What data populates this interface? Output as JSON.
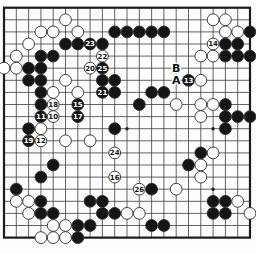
{
  "diagram": {
    "kind": "go-board-diagram",
    "board": {
      "cols": 21,
      "rows": 20,
      "origin_x": 4,
      "origin_y": 7.7,
      "spacing_x": 12.3,
      "spacing_y": 12.1,
      "stone_radius": 5.9
    },
    "colors": {
      "background": "#fdfdfd",
      "grid_line": "#3c3c3c",
      "border_line": "#1c1c1c",
      "black_stone": "#151515",
      "white_stone": "#ffffff",
      "stone_outline": "#2b2b2b",
      "number_on_black": "#ffffff",
      "number_on_white": "#111111",
      "letter_color": "#111111",
      "star_point": "#222222"
    },
    "letters": [
      {
        "c": 14,
        "r": 5,
        "text": "B"
      },
      {
        "c": 14,
        "r": 6,
        "text": "A"
      }
    ],
    "star_points": [
      {
        "c": 10,
        "r": 10
      },
      {
        "c": 17,
        "r": 10
      },
      {
        "c": 17,
        "r": 15
      }
    ],
    "stones": [
      {
        "c": 5,
        "r": 1,
        "color": "white"
      },
      {
        "c": 17,
        "r": 1,
        "color": "white"
      },
      {
        "c": 18,
        "r": 1,
        "color": "white"
      },
      {
        "c": 3,
        "r": 2,
        "color": "white"
      },
      {
        "c": 4,
        "r": 2,
        "color": "white"
      },
      {
        "c": 6,
        "r": 2,
        "color": "white"
      },
      {
        "c": 9,
        "r": 2,
        "color": "black"
      },
      {
        "c": 10,
        "r": 2,
        "color": "black"
      },
      {
        "c": 11,
        "r": 2,
        "color": "black"
      },
      {
        "c": 12,
        "r": 2,
        "color": "black"
      },
      {
        "c": 13,
        "r": 2,
        "color": "black"
      },
      {
        "c": 18,
        "r": 2,
        "color": "white"
      },
      {
        "c": 19,
        "r": 2,
        "color": "white"
      },
      {
        "c": 20,
        "r": 2,
        "color": "black"
      },
      {
        "c": 2,
        "r": 3,
        "color": "white"
      },
      {
        "c": 5,
        "r": 3,
        "color": "black"
      },
      {
        "c": 6,
        "r": 3,
        "color": "black"
      },
      {
        "c": 7,
        "r": 3,
        "color": "black",
        "n": "23"
      },
      {
        "c": 8,
        "r": 3,
        "color": "black"
      },
      {
        "c": 17,
        "r": 3,
        "color": "white",
        "n": "14"
      },
      {
        "c": 18,
        "r": 3,
        "color": "black"
      },
      {
        "c": 19,
        "r": 3,
        "color": "black"
      },
      {
        "c": 1,
        "r": 4,
        "color": "white"
      },
      {
        "c": 3,
        "r": 4,
        "color": "black"
      },
      {
        "c": 4,
        "r": 4,
        "color": "black"
      },
      {
        "c": 8,
        "r": 4,
        "color": "white",
        "n": "22"
      },
      {
        "c": 16,
        "r": 4,
        "color": "white"
      },
      {
        "c": 17,
        "r": 4,
        "color": "white"
      },
      {
        "c": 18,
        "r": 4,
        "color": "black"
      },
      {
        "c": 19,
        "r": 4,
        "color": "black"
      },
      {
        "c": 20,
        "r": 4,
        "color": "black"
      },
      {
        "c": 0,
        "r": 5,
        "color": "white"
      },
      {
        "c": 1,
        "r": 5,
        "color": "white"
      },
      {
        "c": 2,
        "r": 5,
        "color": "black"
      },
      {
        "c": 3,
        "r": 5,
        "color": "black"
      },
      {
        "c": 7,
        "r": 5,
        "color": "white",
        "n": "20"
      },
      {
        "c": 8,
        "r": 5,
        "color": "black",
        "n": "25"
      },
      {
        "c": 2,
        "r": 6,
        "color": "black"
      },
      {
        "c": 3,
        "r": 6,
        "color": "black"
      },
      {
        "c": 5,
        "r": 6,
        "color": "white"
      },
      {
        "c": 8,
        "r": 6,
        "color": "black"
      },
      {
        "c": 9,
        "r": 6,
        "color": "black"
      },
      {
        "c": 16,
        "r": 6,
        "color": "white"
      },
      {
        "c": 15,
        "r": 6,
        "color": "black",
        "n": "13"
      },
      {
        "c": 3,
        "r": 7,
        "color": "black"
      },
      {
        "c": 4,
        "r": 7,
        "color": "white"
      },
      {
        "c": 6,
        "r": 7,
        "color": "white"
      },
      {
        "c": 8,
        "r": 7,
        "color": "black",
        "n": "21"
      },
      {
        "c": 9,
        "r": 7,
        "color": "black"
      },
      {
        "c": 12,
        "r": 7,
        "color": "black"
      },
      {
        "c": 13,
        "r": 7,
        "color": "black"
      },
      {
        "c": 3,
        "r": 8,
        "color": "black"
      },
      {
        "c": 4,
        "r": 8,
        "color": "white",
        "n": "18"
      },
      {
        "c": 6,
        "r": 8,
        "color": "black",
        "n": "15"
      },
      {
        "c": 11,
        "r": 8,
        "color": "black"
      },
      {
        "c": 14,
        "r": 8,
        "color": "white"
      },
      {
        "c": 16,
        "r": 8,
        "color": "white"
      },
      {
        "c": 17,
        "r": 8,
        "color": "white"
      },
      {
        "c": 18,
        "r": 8,
        "color": "black"
      },
      {
        "c": 3,
        "r": 9,
        "color": "black",
        "n": "11"
      },
      {
        "c": 4,
        "r": 9,
        "color": "white",
        "n": "10"
      },
      {
        "c": 6,
        "r": 9,
        "color": "black",
        "n": "17"
      },
      {
        "c": 16,
        "r": 9,
        "color": "white"
      },
      {
        "c": 18,
        "r": 9,
        "color": "black"
      },
      {
        "c": 19,
        "r": 9,
        "color": "black"
      },
      {
        "c": 20,
        "r": 9,
        "color": "black"
      },
      {
        "c": 2,
        "r": 10,
        "color": "black"
      },
      {
        "c": 3,
        "r": 10,
        "color": "white"
      },
      {
        "c": 9,
        "r": 10,
        "color": "black"
      },
      {
        "c": 18,
        "r": 10,
        "color": "black"
      },
      {
        "c": 2,
        "r": 11,
        "color": "black",
        "n": "19"
      },
      {
        "c": 3,
        "r": 11,
        "color": "white",
        "n": "12"
      },
      {
        "c": 5,
        "r": 11,
        "color": "white"
      },
      {
        "c": 7,
        "r": 11,
        "color": "white"
      },
      {
        "c": 9,
        "r": 12,
        "color": "white",
        "n": "24"
      },
      {
        "c": 16,
        "r": 12,
        "color": "black"
      },
      {
        "c": 17,
        "r": 12,
        "color": "white"
      },
      {
        "c": 4,
        "r": 13,
        "color": "black"
      },
      {
        "c": 15,
        "r": 13,
        "color": "black"
      },
      {
        "c": 16,
        "r": 13,
        "color": "white"
      },
      {
        "c": 3,
        "r": 14,
        "color": "black"
      },
      {
        "c": 9,
        "r": 14,
        "color": "white",
        "n": "16"
      },
      {
        "c": 16,
        "r": 14,
        "color": "white"
      },
      {
        "c": 1,
        "r": 15,
        "color": "black"
      },
      {
        "c": 11,
        "r": 15,
        "color": "white",
        "n": "26"
      },
      {
        "c": 12,
        "r": 15,
        "color": "black"
      },
      {
        "c": 14,
        "r": 15,
        "color": "white"
      },
      {
        "c": 1,
        "r": 16,
        "color": "white"
      },
      {
        "c": 2,
        "r": 16,
        "color": "white"
      },
      {
        "c": 3,
        "r": 16,
        "color": "black"
      },
      {
        "c": 7,
        "r": 16,
        "color": "black"
      },
      {
        "c": 8,
        "r": 16,
        "color": "black"
      },
      {
        "c": 17,
        "r": 16,
        "color": "black"
      },
      {
        "c": 18,
        "r": 16,
        "color": "black"
      },
      {
        "c": 19,
        "r": 16,
        "color": "white"
      },
      {
        "c": 2,
        "r": 17,
        "color": "white"
      },
      {
        "c": 3,
        "r": 17,
        "color": "black"
      },
      {
        "c": 4,
        "r": 17,
        "color": "black"
      },
      {
        "c": 8,
        "r": 17,
        "color": "black"
      },
      {
        "c": 9,
        "r": 17,
        "color": "black"
      },
      {
        "c": 10,
        "r": 17,
        "color": "white"
      },
      {
        "c": 11,
        "r": 17,
        "color": "white"
      },
      {
        "c": 17,
        "r": 17,
        "color": "black"
      },
      {
        "c": 18,
        "r": 17,
        "color": "black"
      },
      {
        "c": 20,
        "r": 17,
        "color": "white"
      },
      {
        "c": 4,
        "r": 18,
        "color": "white"
      },
      {
        "c": 5,
        "r": 18,
        "color": "white"
      },
      {
        "c": 6,
        "r": 18,
        "color": "black"
      },
      {
        "c": 7,
        "r": 18,
        "color": "black"
      },
      {
        "c": 12,
        "r": 18,
        "color": "black"
      },
      {
        "c": 13,
        "r": 18,
        "color": "black"
      },
      {
        "c": 3,
        "r": 19,
        "color": "white"
      },
      {
        "c": 4,
        "r": 19,
        "color": "white"
      },
      {
        "c": 5,
        "r": 19,
        "color": "white"
      },
      {
        "c": 6,
        "r": 19,
        "color": "black"
      }
    ]
  }
}
